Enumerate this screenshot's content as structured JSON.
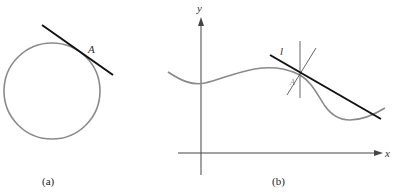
{
  "figure_a": {
    "caption": "(a)",
    "point_label": "A",
    "shape": "circle",
    "tangent": "line tangent to circle at A"
  },
  "figure_b": {
    "caption": "(b)",
    "x_axis_label": "x",
    "y_axis_label": "y",
    "line_label": "l",
    "point_label": "A",
    "curve": "wavy function curve with tangent line l at A"
  },
  "colors": {
    "curve": "#8a8a8a",
    "tangent": "#111111",
    "axis": "#444444"
  }
}
